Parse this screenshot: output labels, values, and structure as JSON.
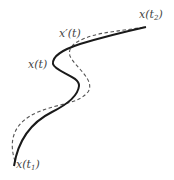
{
  "diagram": {
    "type": "trajectory-variation",
    "curves": [
      {
        "name": "x(t)",
        "style": "solid",
        "color": "#1a1a1a"
      },
      {
        "name": "x'(t)",
        "style": "dashed",
        "color": "#555555"
      }
    ],
    "labels": {
      "x_t2": {
        "base": "x(t",
        "sub": "2",
        "close": ")"
      },
      "x_prime": {
        "text": "x′(t)"
      },
      "x_t": {
        "text": "x(t)"
      },
      "x_t1": {
        "base": "x(t",
        "sub": "1",
        "close": ")"
      }
    }
  }
}
